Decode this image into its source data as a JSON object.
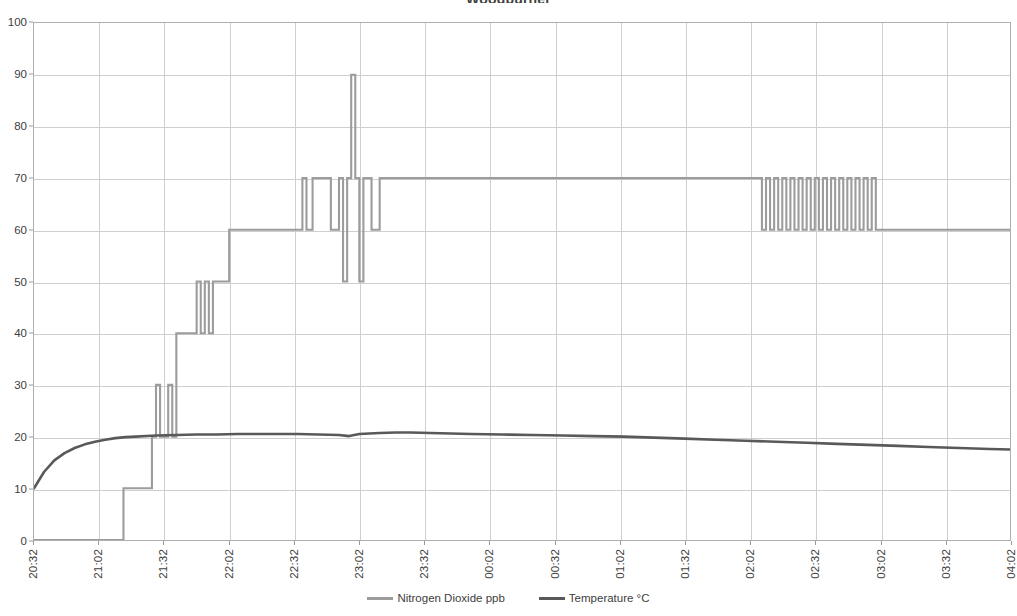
{
  "chart_data": {
    "type": "line",
    "title": "Woodburner",
    "xlabel": "",
    "ylabel": "",
    "ylim": [
      0,
      100
    ],
    "ytick_step": 10,
    "yticks": [
      0,
      10,
      20,
      30,
      40,
      50,
      60,
      70,
      80,
      90,
      100
    ],
    "grid": true,
    "legend_position": "bottom",
    "x_tick_labels": [
      "20:32",
      "21:02",
      "21:32",
      "22:02",
      "22:32",
      "23:02",
      "23:32",
      "00:02",
      "00:32",
      "01:02",
      "01:32",
      "02:02",
      "02:32",
      "03:02",
      "03:32",
      "04:02"
    ],
    "x_range_minutes": [
      0,
      480
    ],
    "series": [
      {
        "name": "Nitrogen Dioxide ppb",
        "color": "#9c9c9c",
        "unit": "ppb",
        "step": true,
        "points": [
          [
            0,
            0
          ],
          [
            44,
            0
          ],
          [
            44,
            10
          ],
          [
            58,
            10
          ],
          [
            58,
            20
          ],
          [
            60,
            20
          ],
          [
            60,
            30
          ],
          [
            62,
            30
          ],
          [
            62,
            20
          ],
          [
            66,
            20
          ],
          [
            66,
            30
          ],
          [
            68,
            30
          ],
          [
            68,
            20
          ],
          [
            70,
            20
          ],
          [
            70,
            40
          ],
          [
            80,
            40
          ],
          [
            80,
            50
          ],
          [
            82,
            50
          ],
          [
            82,
            40
          ],
          [
            84,
            40
          ],
          [
            84,
            50
          ],
          [
            86,
            50
          ],
          [
            86,
            40
          ],
          [
            88,
            40
          ],
          [
            88,
            50
          ],
          [
            96,
            50
          ],
          [
            96,
            60
          ],
          [
            132,
            60
          ],
          [
            132,
            70
          ],
          [
            134,
            70
          ],
          [
            134,
            60
          ],
          [
            137,
            60
          ],
          [
            137,
            70
          ],
          [
            146,
            70
          ],
          [
            146,
            60
          ],
          [
            150,
            60
          ],
          [
            150,
            70
          ],
          [
            152,
            70
          ],
          [
            152,
            50
          ],
          [
            154,
            50
          ],
          [
            154,
            70
          ],
          [
            156,
            70
          ],
          [
            156,
            90
          ],
          [
            158,
            90
          ],
          [
            158,
            70
          ],
          [
            160,
            70
          ],
          [
            160,
            50
          ],
          [
            162,
            50
          ],
          [
            162,
            70
          ],
          [
            166,
            70
          ],
          [
            166,
            60
          ],
          [
            170,
            60
          ],
          [
            170,
            70
          ],
          [
            358,
            70
          ],
          [
            358,
            60
          ],
          [
            360,
            60
          ],
          [
            360,
            70
          ],
          [
            362,
            70
          ],
          [
            362,
            60
          ],
          [
            364,
            60
          ],
          [
            364,
            70
          ],
          [
            366,
            70
          ],
          [
            366,
            60
          ],
          [
            368,
            60
          ],
          [
            368,
            70
          ],
          [
            370,
            70
          ],
          [
            370,
            60
          ],
          [
            372,
            60
          ],
          [
            372,
            70
          ],
          [
            374,
            70
          ],
          [
            374,
            60
          ],
          [
            376,
            60
          ],
          [
            376,
            70
          ],
          [
            378,
            70
          ],
          [
            378,
            60
          ],
          [
            380,
            60
          ],
          [
            380,
            70
          ],
          [
            382,
            70
          ],
          [
            382,
            60
          ],
          [
            384,
            60
          ],
          [
            384,
            70
          ],
          [
            386,
            70
          ],
          [
            386,
            60
          ],
          [
            388,
            60
          ],
          [
            388,
            70
          ],
          [
            390,
            70
          ],
          [
            390,
            60
          ],
          [
            392,
            60
          ],
          [
            392,
            70
          ],
          [
            394,
            70
          ],
          [
            394,
            60
          ],
          [
            396,
            60
          ],
          [
            396,
            70
          ],
          [
            398,
            70
          ],
          [
            398,
            60
          ],
          [
            400,
            60
          ],
          [
            400,
            70
          ],
          [
            402,
            70
          ],
          [
            402,
            60
          ],
          [
            404,
            60
          ],
          [
            404,
            70
          ],
          [
            406,
            70
          ],
          [
            406,
            60
          ],
          [
            408,
            60
          ],
          [
            408,
            70
          ],
          [
            410,
            70
          ],
          [
            410,
            60
          ],
          [
            412,
            60
          ],
          [
            412,
            70
          ],
          [
            414,
            70
          ],
          [
            414,
            60
          ],
          [
            480,
            60
          ]
        ]
      },
      {
        "name": "Temperature °C",
        "color": "#595959",
        "unit": "°C",
        "step": false,
        "points": [
          [
            0,
            10.0
          ],
          [
            5,
            13.2
          ],
          [
            10,
            15.4
          ],
          [
            15,
            16.8
          ],
          [
            20,
            17.8
          ],
          [
            25,
            18.5
          ],
          [
            30,
            19.0
          ],
          [
            35,
            19.4
          ],
          [
            40,
            19.7
          ],
          [
            45,
            19.9
          ],
          [
            50,
            20.0
          ],
          [
            60,
            20.2
          ],
          [
            70,
            20.3
          ],
          [
            80,
            20.4
          ],
          [
            90,
            20.4
          ],
          [
            100,
            20.5
          ],
          [
            110,
            20.5
          ],
          [
            120,
            20.5
          ],
          [
            130,
            20.5
          ],
          [
            140,
            20.4
          ],
          [
            150,
            20.3
          ],
          [
            155,
            20.1
          ],
          [
            160,
            20.5
          ],
          [
            170,
            20.7
          ],
          [
            178,
            20.8
          ],
          [
            185,
            20.8
          ],
          [
            195,
            20.7
          ],
          [
            205,
            20.6
          ],
          [
            215,
            20.5
          ],
          [
            230,
            20.4
          ],
          [
            245,
            20.3
          ],
          [
            260,
            20.2
          ],
          [
            275,
            20.1
          ],
          [
            290,
            20.0
          ],
          [
            305,
            19.8
          ],
          [
            320,
            19.6
          ],
          [
            335,
            19.4
          ],
          [
            350,
            19.2
          ],
          [
            365,
            19.0
          ],
          [
            380,
            18.8
          ],
          [
            395,
            18.6
          ],
          [
            410,
            18.4
          ],
          [
            425,
            18.2
          ],
          [
            440,
            18.0
          ],
          [
            455,
            17.8
          ],
          [
            470,
            17.6
          ],
          [
            480,
            17.5
          ]
        ]
      }
    ]
  },
  "legend": {
    "items": [
      {
        "label": "Nitrogen Dioxide ppb",
        "color": "#9c9c9c"
      },
      {
        "label": "Temperature °C",
        "color": "#595959"
      }
    ]
  },
  "axis_colors": {
    "grid": "#cfcfcf",
    "frame": "#aeaeae",
    "text": "#404040"
  }
}
